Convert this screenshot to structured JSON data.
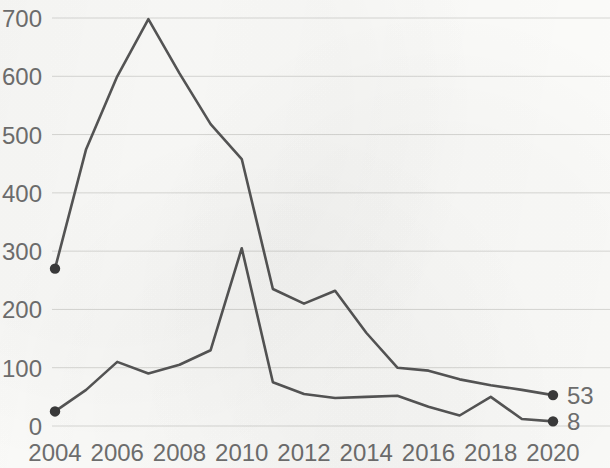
{
  "chart_data": {
    "type": "line",
    "title": "",
    "subtitle": "",
    "xlabel": "",
    "ylabel": "",
    "x": [
      2004,
      2005,
      2006,
      2007,
      2008,
      2009,
      2010,
      2011,
      2012,
      2013,
      2014,
      2015,
      2016,
      2017,
      2018,
      2019,
      2020
    ],
    "xtick_labels": [
      "2004",
      "2006",
      "2008",
      "2010",
      "2012",
      "2014",
      "2016",
      "2018",
      "2020"
    ],
    "xticks": [
      2004,
      2006,
      2008,
      2010,
      2012,
      2014,
      2016,
      2018,
      2020
    ],
    "ytick_labels": [
      "0",
      "100",
      "200",
      "300",
      "400",
      "500",
      "600",
      "700"
    ],
    "yticks": [
      0,
      100,
      200,
      300,
      400,
      500,
      600,
      700
    ],
    "ylim": [
      0,
      700
    ],
    "xlim": [
      2004,
      2020
    ],
    "grid": "horizontal",
    "legend": "none",
    "legend_position": "none",
    "series": [
      {
        "name": "series-1",
        "color": "#555555",
        "end_label": "53",
        "start_marker": true,
        "end_marker": true,
        "values": [
          270,
          475,
          600,
          698,
          605,
          518,
          458,
          235,
          210,
          232,
          160,
          100,
          95,
          80,
          70,
          62,
          53
        ]
      },
      {
        "name": "series-2",
        "color": "#555555",
        "end_label": "8",
        "start_marker": true,
        "end_marker": true,
        "values": [
          25,
          62,
          110,
          90,
          105,
          130,
          305,
          75,
          55,
          48,
          50,
          52,
          33,
          18,
          50,
          12,
          8
        ]
      }
    ],
    "annotations": [
      {
        "name": "end-value-series-1",
        "text": "53",
        "x": 2020,
        "y": 53
      },
      {
        "name": "end-value-series-2",
        "text": "8",
        "x": 2020,
        "y": 8
      }
    ],
    "colors": {
      "line": "#555555",
      "gridline": "#d7d7d4",
      "tick_label": "#6e6e6e",
      "background": "#fbfbf9",
      "marker": "#3a3a3a"
    }
  }
}
